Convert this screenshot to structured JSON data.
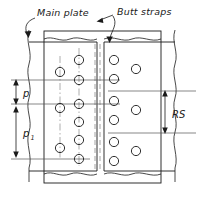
{
  "drawing": {
    "type": "engineering-drawing",
    "subject": "riveted butt joint with double butt straps",
    "annotations": {
      "main_plate_label": "Main plate",
      "butt_straps_label": "Butt straps"
    },
    "dimensions": [
      {
        "id": "p",
        "label": "p",
        "subscript": "",
        "orientation": "vertical",
        "side": "left",
        "meaning": "rivet pitch"
      },
      {
        "id": "p1",
        "label": "p",
        "subscript": "1",
        "orientation": "vertical",
        "side": "left",
        "meaning": "back pitch"
      },
      {
        "id": "RS",
        "label": "RS",
        "subscript": "",
        "orientation": "vertical",
        "side": "right",
        "meaning": "row spacing"
      }
    ],
    "colors": {
      "line": "#1a1a1a",
      "thin_line": "#555555",
      "center_line": "#8a8a8a",
      "hidden_line": "#9a9a9a",
      "background": "#ffffff"
    },
    "features": {
      "left_plate_rivet_columns": [
        {
          "column": "outer",
          "hole_count": 3
        },
        {
          "column": "inner",
          "hole_count": 6
        }
      ],
      "right_plate_rivet_columns": [
        {
          "column": "inner",
          "hole_count": 6
        },
        {
          "column": "outer",
          "hole_count": 3
        }
      ],
      "joint_gap": "center butt line shown as two hidden dashed lines",
      "break_lines": "wavy break lines on all four plate edges"
    }
  }
}
